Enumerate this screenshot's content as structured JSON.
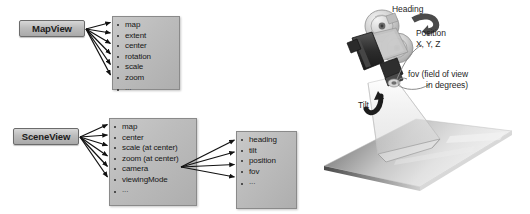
{
  "diagram": {
    "classes": [
      {
        "id": "mapview",
        "label": "MapView"
      },
      {
        "id": "sceneview",
        "label": "SceneView"
      }
    ],
    "property_boxes": [
      {
        "id": "mapview-props",
        "owner": "MapView",
        "items": [
          "map",
          "extent",
          "center",
          "rotation",
          "scale",
          "zoom",
          "..."
        ]
      },
      {
        "id": "sceneview-props",
        "owner": "SceneView",
        "items": [
          "map",
          "center",
          "scale (at center)",
          "zoom (at center)",
          "camera",
          "viewingMode",
          "..."
        ]
      },
      {
        "id": "camera-props",
        "owner": "camera",
        "items": [
          "heading",
          "tilt",
          "position",
          "fov",
          "..."
        ]
      }
    ]
  },
  "illustration": {
    "annotations": {
      "heading": "Heading",
      "position_line1": "Position",
      "position_line2": "X, Y, Z",
      "fov_line1": "fov (field of view",
      "fov_line2": "in degrees)",
      "tilt": "Tilt"
    },
    "icons": {
      "camera": "movie-camera-icon",
      "ground": "ground-plane-icon",
      "frustum": "view-frustum-icon",
      "heading_arrow": "heading-rotation-arrow-icon",
      "tilt_arrow": "tilt-rotation-arrow-icon"
    }
  },
  "colors": {
    "box_fill_light": "#d7d7d7",
    "box_fill_dark": "#a9a9a9",
    "box_border": "#6b6b6b",
    "connector": "#111111",
    "text": "#1a1a1a"
  }
}
